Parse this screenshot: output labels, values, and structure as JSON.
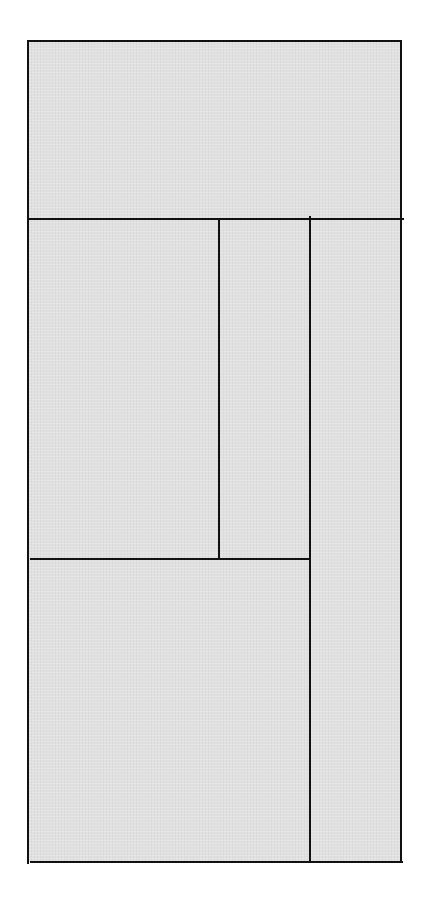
{
  "artwork": {
    "description": "Rectilinear composition of gray panels divided by black lines",
    "colors": {
      "fill": "#e1e1e1",
      "line": "#111111",
      "background": "#ffffff"
    },
    "bounds": {
      "left": 28,
      "top": 41,
      "right": 402,
      "bottom": 862
    },
    "panels": [
      {
        "name": "top-panel",
        "x": 28,
        "y": 41,
        "w": 374,
        "h": 178
      },
      {
        "name": "middle-left-panel",
        "x": 28,
        "y": 219,
        "w": 191,
        "h": 340
      },
      {
        "name": "middle-center-panel",
        "x": 219,
        "y": 219,
        "w": 90,
        "h": 340
      },
      {
        "name": "right-tall-panel",
        "x": 309,
        "y": 219,
        "w": 93,
        "h": 643
      },
      {
        "name": "bottom-left-panel",
        "x": 28,
        "y": 559,
        "w": 281,
        "h": 303
      }
    ]
  }
}
